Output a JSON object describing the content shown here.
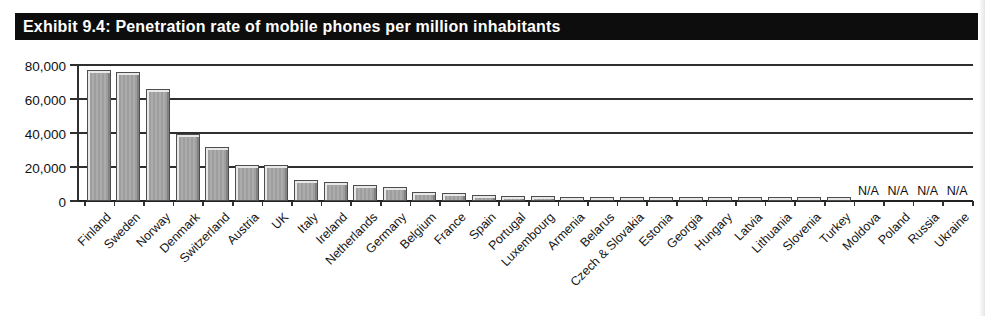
{
  "page": {
    "exhibit_title": "Exhibit 9.4: Penetration rate of mobile phones per million inhabitants"
  },
  "chart_data": {
    "type": "bar",
    "title": "Exhibit 9.4: Penetration rate of mobile phones per million inhabitants",
    "xlabel": "",
    "ylabel": "",
    "ylim": [
      0,
      80000
    ],
    "ytick_values": [
      80000,
      60000,
      40000,
      20000,
      0
    ],
    "ytick_labels": [
      "80,000",
      "60,000",
      "40,000",
      "20,000",
      "0"
    ],
    "grid": true,
    "legend": false,
    "na_label": "N/A",
    "categories": [
      "Finland",
      "Sweden",
      "Norway",
      "Denmark",
      "Switzerland",
      "Austria",
      "UK",
      "Italy",
      "Ireland",
      "Netherlands",
      "Germany",
      "Belgium",
      "France",
      "Spain",
      "Portugal",
      "Luxembourg",
      "Armenia",
      "Belarus",
      "Czech & Slovakia",
      "Estonia",
      "Georgia",
      "Hungary",
      "Latvia",
      "Lithuania",
      "Slovenia",
      "Turkey",
      "Moldova",
      "Poland",
      "Russia",
      "Ukraine"
    ],
    "values": [
      77000,
      76000,
      66000,
      39500,
      31500,
      21000,
      21000,
      12500,
      11000,
      9500,
      8000,
      5000,
      4500,
      3500,
      3000,
      2800,
      2600,
      2600,
      2600,
      2500,
      2400,
      2300,
      2300,
      2200,
      2200,
      2100,
      null,
      null,
      null,
      null
    ]
  },
  "colors": {
    "title_bg": "#0d0d0d",
    "title_text": "#ffffff",
    "bar_fill": "#a6a6a6",
    "bar_highlight": "#e8e8e8",
    "bar_shadow": "#828282",
    "bar_outline": "#4d4d4d",
    "axis_line": "#2f2f2f",
    "background": "#ffffff"
  }
}
